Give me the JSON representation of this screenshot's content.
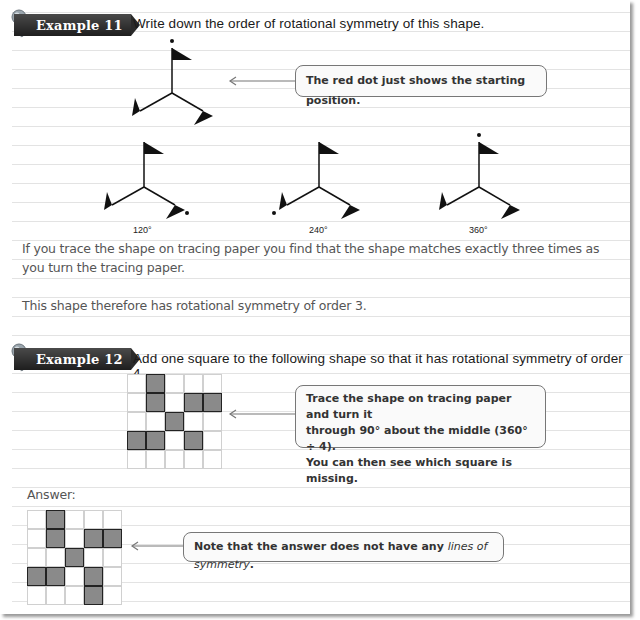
{
  "example11": {
    "badge": "Example 11",
    "prompt": "Write down the order of rotational symmetry of this shape.",
    "callout": "The red dot just shows the starting position.",
    "rotations": [
      {
        "label": "120°"
      },
      {
        "label": "240°"
      },
      {
        "label": "360°"
      }
    ],
    "explanation_line1": "If you trace the shape on tracing paper you find that the shape matches exactly three times as",
    "explanation_line2": "you turn the tracing paper.",
    "conclusion": "This shape therefore has rotational symmetry of order 3."
  },
  "example12": {
    "badge": "Example 12",
    "prompt": "Add one square to the following shape so that it has rotational symmetry of order 4.",
    "callout_line1": "Trace the shape on tracing paper and turn it",
    "callout_line2": "through 90° about the middle (360° ÷ 4).",
    "callout_line3": "You can then see which square is missing.",
    "question_grid": {
      "rows": 5,
      "cols": 5,
      "filled": [
        [
          0,
          1
        ],
        [
          1,
          1
        ],
        [
          1,
          3
        ],
        [
          1,
          4
        ],
        [
          2,
          2
        ],
        [
          3,
          0
        ],
        [
          3,
          1
        ],
        [
          3,
          3
        ]
      ]
    },
    "answer_label": "Answer:",
    "answer_grid": {
      "rows": 5,
      "cols": 5,
      "filled": [
        [
          0,
          1
        ],
        [
          1,
          1
        ],
        [
          1,
          3
        ],
        [
          1,
          4
        ],
        [
          2,
          2
        ],
        [
          3,
          0
        ],
        [
          3,
          1
        ],
        [
          3,
          3
        ],
        [
          4,
          3
        ]
      ]
    },
    "answer_callout_prefix": "Note that the answer does not have any ",
    "answer_callout_italic": "lines of symmetry",
    "answer_callout_suffix": "."
  },
  "colors": {
    "badge_bg": "#2a2a2a",
    "filled_square": "#8a8a8a",
    "ruled_line": "#e3e3e3"
  }
}
